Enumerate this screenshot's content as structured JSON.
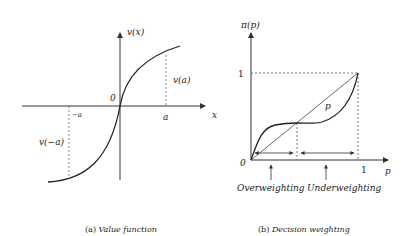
{
  "panel_a": {
    "y_axis_label": "v(x)",
    "x_axis_label": "x",
    "origin_label": "0",
    "tick_a": "a",
    "tick_neg_a": "−a",
    "value_a_label": "v(a)",
    "value_neg_a_label": "v(−a)",
    "caption_prefix": "(a)",
    "caption": "Value function"
  },
  "panel_b": {
    "y_axis_label": "π(p)",
    "x_axis_label": "p",
    "origin_label": "0",
    "tick_x_one": "1",
    "tick_y_one": "1",
    "diagonal_label": "p",
    "region_left_label": "Overweighting",
    "region_right_label": "Underweighting",
    "caption_prefix": "(b)",
    "caption": "Decision weighting"
  },
  "colors": {
    "line": "#222222",
    "axis": "#333333",
    "dashed": "#555555"
  }
}
